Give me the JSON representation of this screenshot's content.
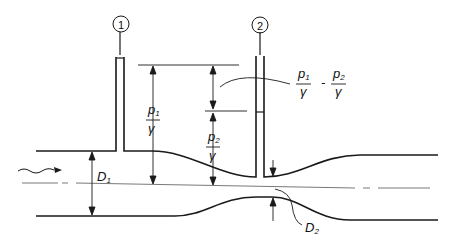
{
  "diagram": {
    "type": "venturi-meter",
    "piezometers": [
      {
        "id": "1",
        "label": "1"
      },
      {
        "id": "2",
        "label": "2"
      }
    ],
    "labels": {
      "p1": "p",
      "p1_sub": "1",
      "p2": "p",
      "p2_sub": "2",
      "gamma": "γ",
      "minus": "-",
      "D1": "D",
      "D1_sub": "1",
      "D2": "D",
      "D2_sub": "2"
    },
    "colors": {
      "line": "#1a1a1a",
      "background": "#ffffff"
    }
  }
}
